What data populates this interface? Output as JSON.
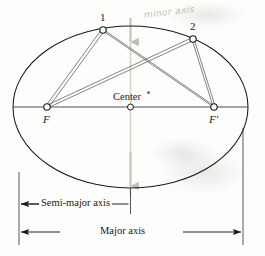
{
  "figure": {
    "background_color": "#fdfdfc",
    "line_color": "#1a1a1a",
    "ray_color": "#6e6e6e",
    "faint_color": "#c6c2bb"
  },
  "labels": {
    "point_1": "1",
    "point_2": "2",
    "focus_left": "F",
    "focus_right": "F′",
    "center": "Center",
    "semi_major_axis": "Semi-major axis",
    "major_axis": "Major axis",
    "minor_axis_handwritten": "minor axis"
  },
  "geometry": {
    "ellipse": {
      "cx": 130.5,
      "cy": 107,
      "rx": 117.5,
      "ry": 81,
      "left_vertex_x": 13,
      "right_vertex_x": 248,
      "top_vertex_y": 26,
      "bottom_vertex_y": 188
    },
    "center_point": {
      "x": 130.5,
      "y": 107
    },
    "focus_left_point": {
      "x": 47,
      "y": 107
    },
    "focus_right_point": {
      "x": 214,
      "y": 107
    },
    "point_1": {
      "x": 103,
      "y": 30
    },
    "point_2": {
      "x": 193,
      "y": 39
    },
    "major_axis_line_y": 107,
    "minor_axis_line_x": 130.5
  },
  "rays": [
    {
      "name": "F-to-1",
      "from": "focus_left_point",
      "to": "point_1"
    },
    {
      "name": "F-to-2",
      "from": "focus_left_point",
      "to": "point_2"
    },
    {
      "name": "Fprime-to-1",
      "from": "focus_right_point",
      "to": "point_1"
    },
    {
      "name": "Fprime-to-2",
      "from": "focus_right_point",
      "to": "point_2"
    }
  ],
  "dimensions": [
    {
      "name": "semi-major-axis",
      "label": "Semi-major axis",
      "y": 204,
      "x_start": 19,
      "x_end": 130.5,
      "arrows": "both"
    },
    {
      "name": "major-axis",
      "label": "Major axis",
      "y": 232,
      "x_start": 19,
      "x_end": 243,
      "arrows": "both"
    }
  ],
  "extension_lines": [
    {
      "name": "left-extension",
      "x": 19,
      "y_top": 170,
      "y_bottom": 245
    },
    {
      "name": "center-extension",
      "x": 130.5,
      "y_top": 107,
      "y_bottom": 212
    },
    {
      "name": "right-extension",
      "x": 243,
      "y_top": 120,
      "y_bottom": 245
    }
  ],
  "annotations": {
    "minor_axis_arrow_top": {
      "x": 130.5,
      "y_from": 20,
      "y_to": 46
    },
    "minor_axis_arrow_bottom": {
      "x": 130.5,
      "y_from": 150,
      "y_to": 192
    }
  }
}
